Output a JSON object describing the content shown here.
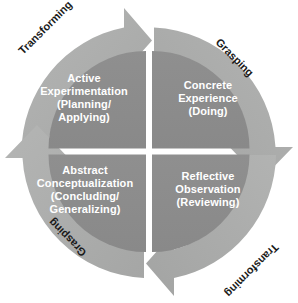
{
  "diagram": {
    "colors": {
      "background": "#ffffff",
      "quadrant_fill": "#8c8c8c",
      "ring_fill": "#abacab",
      "ring_fill_light": "#b7b8b7",
      "divider": "#ffffff",
      "quadrant_text": "#ffffff",
      "ring_text": "#1a1a1a"
    },
    "quadrants": [
      {
        "id": "active-experimentation",
        "position": "top-left",
        "line1": "Active",
        "line2": "Experimentation",
        "line3": "(Planning/",
        "line4": "Applying)",
        "text": "Active\nExperimentation\n(Planning/\nApplying)"
      },
      {
        "id": "concrete-experience",
        "position": "top-right",
        "line1": "Concrete",
        "line2": "Experience",
        "line3": "(Doing)",
        "text": "Concrete\nExperience\n(Doing)"
      },
      {
        "id": "abstract-conceptualization",
        "position": "bottom-left",
        "line1": "Abstract",
        "line2": "Conceptualization",
        "line3": "(Concluding/",
        "line4": "Generalizing)",
        "text": "Abstract\nConceptualization\n(Concluding/\nGeneralizing)"
      },
      {
        "id": "reflective-observation",
        "position": "bottom-right",
        "line1": "Reflective",
        "line2": "Observation",
        "line3": "(Reviewing)",
        "text": "Reflective\nObservation\n(Reviewing)"
      }
    ],
    "ring_labels": [
      {
        "id": "transforming-top-left",
        "text": "Transforming",
        "position": "top-left",
        "rotation_deg": -45
      },
      {
        "id": "grasping-top-right",
        "text": "Grasping",
        "position": "top-right",
        "rotation_deg": 45
      },
      {
        "id": "grasping-bottom-left",
        "text": "Grasping",
        "position": "bottom-left",
        "rotation_deg": 225
      },
      {
        "id": "transforming-bottom-right",
        "text": "Transforming",
        "position": "bottom-right",
        "rotation_deg": 135
      }
    ],
    "arrows": [
      {
        "id": "arrow-top",
        "direction": "right",
        "at": "top-center"
      },
      {
        "id": "arrow-right",
        "direction": "down",
        "at": "right-middle"
      },
      {
        "id": "arrow-bottom",
        "direction": "left",
        "at": "bottom-center"
      },
      {
        "id": "arrow-left",
        "direction": "up",
        "at": "left-middle"
      }
    ],
    "flow": "clockwise"
  }
}
